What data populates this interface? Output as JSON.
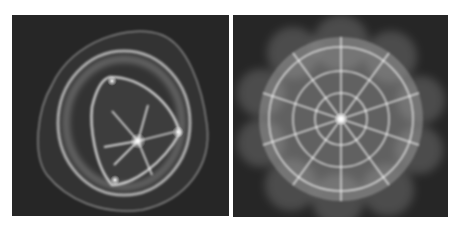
{
  "figure": {
    "panels": [
      {
        "id": "left",
        "subject": "cymatic-pattern-triangular-star",
        "background": "#262626",
        "foreground": "#e6e6e6"
      },
      {
        "id": "right",
        "subject": "cymatic-pattern-radial-web",
        "background": "#262626",
        "foreground": "#e6e6e6"
      }
    ]
  }
}
